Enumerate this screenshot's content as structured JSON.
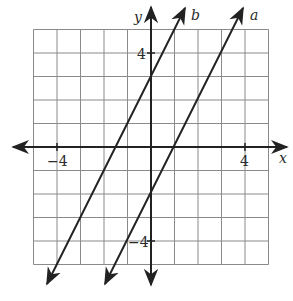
{
  "chart_data": {
    "type": "line",
    "title": "",
    "xlabel": "x",
    "ylabel": "y",
    "xlim": [
      -5,
      5
    ],
    "ylim": [
      -5,
      5
    ],
    "grid": true,
    "x_tick_labels": [
      "-4",
      "4"
    ],
    "y_tick_labels": [
      "4",
      "-4"
    ],
    "series": [
      {
        "name": "a",
        "equation": "y = 2x - 2",
        "slope": 2,
        "y_intercept": -2,
        "x_intercept": 1
      },
      {
        "name": "b",
        "equation": "y = 2x + 3",
        "slope": 2,
        "y_intercept": 3,
        "x_intercept": -1.5
      }
    ]
  },
  "labels": {
    "x_axis": "x",
    "y_axis": "y",
    "line_a": "a",
    "line_b": "b",
    "tick_x_neg4": "−4",
    "tick_x_pos4": "4",
    "tick_y_pos4": "4",
    "tick_y_neg4": "−4"
  },
  "colors": {
    "line": "#222222",
    "grid": "#8a8a8a"
  }
}
